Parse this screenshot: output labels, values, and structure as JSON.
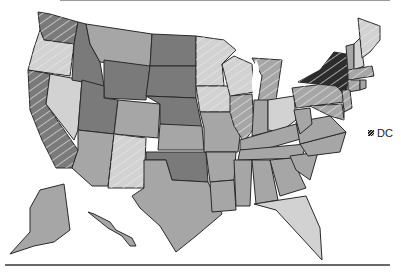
{
  "legend": {
    "dc_label": "DC",
    "dc_category": "hatched-dark"
  },
  "colors": {
    "light": "#d2d2d2",
    "medium": "#a6a6a6",
    "dark": "#7a7a7a",
    "darkest": "#2c2c2c",
    "hatch": "#e8e8e8",
    "border": "#2a2a2a",
    "rule": "#6a6a6a"
  },
  "map": {
    "type": "choropleth",
    "region": "United States",
    "categories": [
      "light",
      "medium",
      "dark",
      "hatched-light",
      "hatched-medium",
      "hatched-dark",
      "hatched-darkest"
    ],
    "states": {
      "WA": "hatched-dark",
      "OR": "hatched-light",
      "CA": "hatched-dark",
      "NV": "light",
      "ID": "dark",
      "MT": "medium",
      "WY": "dark",
      "UT": "dark",
      "AZ": "medium",
      "CO": "medium",
      "NM": "hatched-light",
      "ND": "dark",
      "SD": "dark",
      "NE": "dark",
      "KS": "medium",
      "OK": "dark",
      "TX": "medium",
      "MN": "hatched-light",
      "IA": "hatched-light",
      "MO": "medium",
      "AR": "medium",
      "LA": "medium",
      "WI": "hatched-light",
      "IL": "hatched-medium",
      "MI": "hatched-medium",
      "IN": "medium",
      "OH": "light",
      "KY": "medium",
      "TN": "medium",
      "MS": "medium",
      "AL": "medium",
      "GA": "medium",
      "FL": "light",
      "SC": "medium",
      "NC": "medium",
      "VA": "medium",
      "WV": "medium",
      "PA": "hatched-medium",
      "NY": "hatched-darkest",
      "VT": "medium",
      "NH": "light",
      "ME": "hatched-light",
      "MA": "hatched-medium",
      "CT": "hatched-medium",
      "RI": "medium",
      "NJ": "hatched-medium",
      "DE": "medium",
      "MD": "hatched-medium",
      "AK": "medium",
      "HI": "medium"
    }
  }
}
